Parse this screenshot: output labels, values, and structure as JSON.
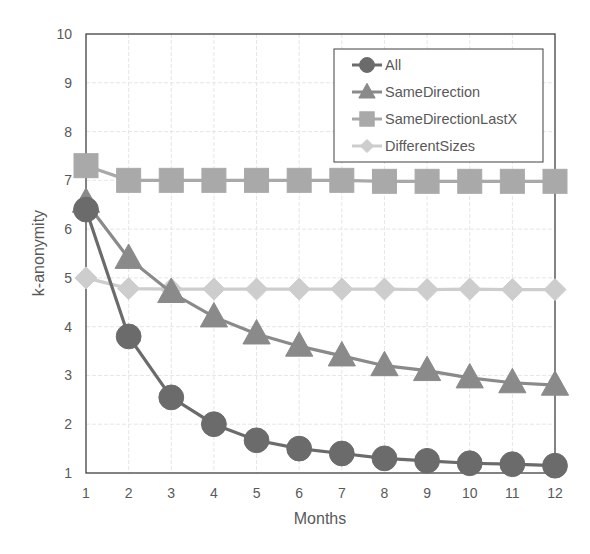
{
  "chart_data": {
    "type": "line",
    "title": "",
    "xlabel": "Months",
    "ylabel": "k-anonymity",
    "x": [
      1,
      2,
      3,
      4,
      5,
      6,
      7,
      8,
      9,
      10,
      11,
      12
    ],
    "xlim": [
      1,
      12
    ],
    "ylim": [
      1,
      10
    ],
    "yticks": [
      1,
      2,
      3,
      4,
      5,
      6,
      7,
      8,
      9,
      10
    ],
    "grid": true,
    "legend_position": "upper right (inside)",
    "series": [
      {
        "name": "All",
        "marker": "circle",
        "color": "#6b6b6b",
        "values": [
          6.4,
          3.8,
          2.55,
          2.0,
          1.67,
          1.5,
          1.4,
          1.3,
          1.25,
          1.2,
          1.18,
          1.15
        ]
      },
      {
        "name": "SameDirection",
        "marker": "triangle",
        "color": "#8a8a8a",
        "values": [
          6.55,
          5.4,
          4.7,
          4.2,
          3.85,
          3.6,
          3.4,
          3.2,
          3.1,
          2.95,
          2.85,
          2.8
        ]
      },
      {
        "name": "SameDirectionLastX",
        "marker": "square",
        "color": "#a9a9a9",
        "values": [
          7.3,
          7.0,
          7.0,
          7.0,
          7.0,
          7.0,
          7.0,
          6.98,
          6.98,
          6.98,
          6.98,
          6.98
        ]
      },
      {
        "name": "DifferentSizes",
        "marker": "diamond",
        "color": "#cdcdcd",
        "values": [
          5.0,
          4.78,
          4.77,
          4.77,
          4.77,
          4.77,
          4.77,
          4.77,
          4.76,
          4.77,
          4.76,
          4.76
        ]
      }
    ]
  }
}
